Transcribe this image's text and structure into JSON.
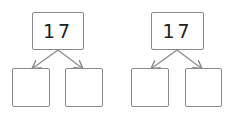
{
  "diagrams": [
    {
      "top_value": "17",
      "bottom_left": "",
      "bottom_right": ""
    },
    {
      "top_value": "17",
      "bottom_left": "",
      "bottom_right": ""
    }
  ],
  "colors": {
    "border": "#8a8a8a",
    "arrow": "#8a8a8a",
    "text": "#222222"
  }
}
